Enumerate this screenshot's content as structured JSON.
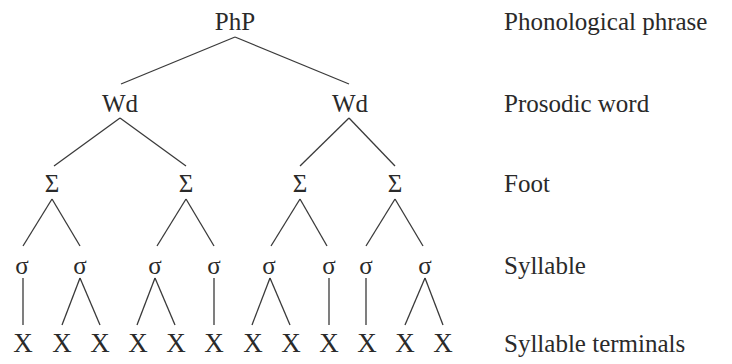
{
  "diagram": {
    "type": "prosodic-hierarchy-tree",
    "levels": [
      {
        "id": "php",
        "label": "Phonological phrase",
        "y": 21
      },
      {
        "id": "wd",
        "label": "Prosodic word",
        "y": 103
      },
      {
        "id": "foot",
        "label": "Foot",
        "y": 183
      },
      {
        "id": "syl",
        "label": "Syllable",
        "y": 265
      },
      {
        "id": "term",
        "label": "Syllable terminals",
        "y": 343
      }
    ],
    "nodes": {
      "php": [
        {
          "text": "PhP",
          "x": 235
        }
      ],
      "wd": [
        {
          "text": "Wd",
          "x": 120
        },
        {
          "text": "Wd",
          "x": 350
        }
      ],
      "foot": [
        {
          "text": "Σ",
          "x": 52
        },
        {
          "text": "Σ",
          "x": 186
        },
        {
          "text": "Σ",
          "x": 300
        },
        {
          "text": "Σ",
          "x": 395
        }
      ],
      "syl": [
        {
          "text": "σ",
          "x": 22
        },
        {
          "text": "σ",
          "x": 80
        },
        {
          "text": "σ",
          "x": 155
        },
        {
          "text": "σ",
          "x": 214
        },
        {
          "text": "σ",
          "x": 269
        },
        {
          "text": "σ",
          "x": 329
        },
        {
          "text": "σ",
          "x": 366
        },
        {
          "text": "σ",
          "x": 425
        }
      ],
      "term": [
        {
          "text": "X",
          "x": 23
        },
        {
          "text": "X",
          "x": 62
        },
        {
          "text": "X",
          "x": 100
        },
        {
          "text": "X",
          "x": 138
        },
        {
          "text": "X",
          "x": 176
        },
        {
          "text": "X",
          "x": 214
        },
        {
          "text": "X",
          "x": 253
        },
        {
          "text": "X",
          "x": 291
        },
        {
          "text": "X",
          "x": 329
        },
        {
          "text": "X",
          "x": 367
        },
        {
          "text": "X",
          "x": 405
        },
        {
          "text": "X",
          "x": 443
        }
      ]
    },
    "edges": [
      [
        235,
        37,
        121,
        84
      ],
      [
        235,
        37,
        349,
        84
      ],
      [
        120,
        118,
        54,
        166
      ],
      [
        120,
        118,
        186,
        166
      ],
      [
        349,
        118,
        300,
        166
      ],
      [
        349,
        118,
        395,
        166
      ],
      [
        52,
        199,
        23,
        246
      ],
      [
        52,
        199,
        80,
        246
      ],
      [
        186,
        199,
        157,
        246
      ],
      [
        186,
        199,
        214,
        246
      ],
      [
        300,
        199,
        271,
        246
      ],
      [
        300,
        199,
        327,
        246
      ],
      [
        395,
        199,
        366,
        246
      ],
      [
        395,
        199,
        423,
        246
      ],
      [
        23,
        278,
        23,
        325
      ],
      [
        80,
        278,
        62,
        325
      ],
      [
        80,
        278,
        100,
        325
      ],
      [
        155,
        278,
        137,
        325
      ],
      [
        155,
        278,
        175,
        325
      ],
      [
        214,
        278,
        214,
        325
      ],
      [
        270,
        278,
        252,
        325
      ],
      [
        270,
        278,
        290,
        325
      ],
      [
        329,
        278,
        329,
        325
      ],
      [
        366,
        278,
        366,
        325
      ],
      [
        425,
        278,
        405,
        325
      ],
      [
        425,
        278,
        443,
        325
      ]
    ],
    "line_color": "#3a3a3a",
    "text_color": "#2a2a2a"
  }
}
